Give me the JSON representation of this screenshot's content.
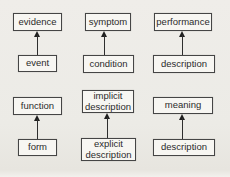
{
  "diagram": {
    "title_hidden": "",
    "pairs": [
      {
        "top": "evidence",
        "bottom": "event"
      },
      {
        "top": "symptom",
        "bottom": "condition"
      },
      {
        "top": "performance",
        "bottom": "description"
      },
      {
        "top": "function",
        "bottom": "form"
      },
      {
        "top": "implicit\ndescription",
        "bottom": "explicit\ndescription"
      },
      {
        "top": "meaning",
        "bottom": "description"
      }
    ],
    "arrow_direction": "bottom-to-top",
    "colors": {
      "background": "#ecebe6",
      "box_fill": "#f7f6f2",
      "box_border": "#454545",
      "text": "#2b2b2b",
      "arrow": "#1f1f1f"
    }
  }
}
